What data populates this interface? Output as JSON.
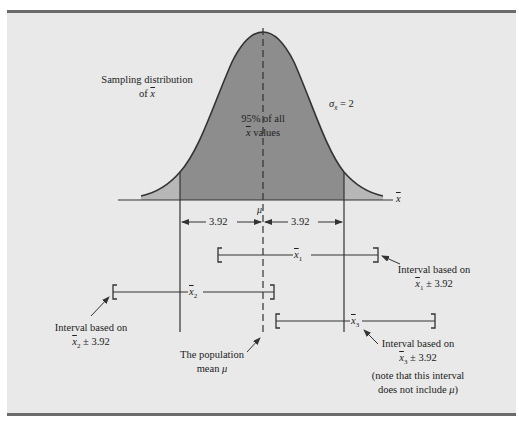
{
  "figure": {
    "title_top_cropped": "",
    "colors": {
      "background": "#e9e9e9",
      "rule": "#6b6b6b",
      "fill_95": "#8d8d8d",
      "fill_tail": "#b7b7b7",
      "line": "#333333"
    },
    "curve_label": {
      "line1": "Sampling distribution",
      "line2_prefix": "of ",
      "line2_var": "x"
    },
    "sigma_label": {
      "symbol": "σ",
      "sub": "x̄",
      "eq": " = 2"
    },
    "center_label": {
      "line1": "95% of all",
      "line2_var": "x",
      "line2_suffix": " values"
    },
    "axis_label": "x",
    "mu_label": "μ",
    "margin_left": "3.92",
    "margin_right": "3.92",
    "intervals": [
      {
        "var": "x",
        "sub": "1",
        "caption1": "Interval based on",
        "caption2_var": "x",
        "caption2_sub": "1",
        "caption2_suffix": " ± 3.92"
      },
      {
        "var": "x",
        "sub": "2",
        "caption1": "Interval based on",
        "caption2_var": "x",
        "caption2_sub": "2",
        "caption2_suffix": " ± 3.92"
      },
      {
        "var": "x",
        "sub": "3",
        "caption1": "Interval based on",
        "caption2_var": "x",
        "caption2_sub": "3",
        "caption2_suffix": " ± 3.92",
        "caption3": "(note that this interval",
        "caption4_prefix": "does not include ",
        "caption4_var": "μ",
        "caption4_suffix": ")"
      }
    ],
    "population_mean_label": {
      "line1": "The population",
      "line2_prefix": "mean ",
      "line2_var": "μ"
    }
  }
}
